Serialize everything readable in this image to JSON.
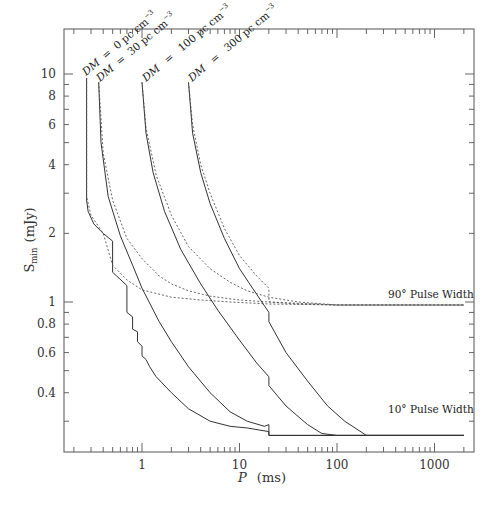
{
  "chart_data": {
    "type": "line",
    "title": "",
    "xlabel": "P (ms)",
    "ylabel": "S_min (mJy)",
    "xscale": "log",
    "yscale": "log",
    "xlim": [
      0.16,
      2500
    ],
    "ylim": [
      0.22,
      15.5
    ],
    "grid": false,
    "legend": "none (inline annotations)",
    "x_ticks": [
      1,
      10,
      100,
      1000
    ],
    "x_tick_labels": [
      "1",
      "10",
      "100",
      "1000"
    ],
    "y_ticks": [
      0.4,
      0.6,
      0.8,
      1,
      2,
      4,
      6,
      8,
      10
    ],
    "y_tick_labels": [
      "0.4",
      "0.6",
      "0.8",
      "1",
      "2",
      "4",
      "6",
      "8",
      "10"
    ],
    "annotations": [
      {
        "text": "DM = 0 pc cm⁻³",
        "x": 0.27,
        "y": 9.6,
        "rotation": -40
      },
      {
        "text": "DM = 30 pc cm⁻³",
        "x": 0.35,
        "y": 9.2,
        "rotation": -40
      },
      {
        "text": "DM = 100 pc cm⁻³",
        "x": 1.0,
        "y": 9.2,
        "rotation": -40
      },
      {
        "text": "DM = 300 pc cm⁻³",
        "x": 3.0,
        "y": 9.2,
        "rotation": -40
      },
      {
        "text": "90° Pulse Width",
        "x": 180,
        "y": 1.08
      },
      {
        "text": "10° Pulse Width",
        "x": 180,
        "y": 0.295
      }
    ],
    "series": [
      {
        "name": "DM = 0, 10° pulse width",
        "style": "solid",
        "x": [
          0.27,
          0.27,
          0.28,
          0.32,
          0.4,
          0.5,
          0.5,
          0.55,
          0.7,
          0.7,
          0.8,
          0.8,
          0.9,
          0.9,
          1.0,
          1.0,
          1.1,
          1.2,
          1.4,
          2,
          3,
          5,
          8,
          12,
          20,
          20,
          40,
          100,
          300,
          1000,
          2000
        ],
        "y": [
          9.6,
          2.8,
          2.5,
          2.2,
          2.0,
          1.85,
          1.35,
          1.3,
          1.18,
          0.9,
          0.86,
          0.76,
          0.74,
          0.67,
          0.64,
          0.58,
          0.56,
          0.52,
          0.47,
          0.4,
          0.34,
          0.3,
          0.285,
          0.28,
          0.27,
          0.26,
          0.26,
          0.26,
          0.26,
          0.26,
          0.26
        ]
      },
      {
        "name": "DM = 0, 90° pulse width",
        "style": "dotted",
        "x": [
          0.27,
          0.27,
          0.3,
          0.4,
          0.5,
          0.7,
          1,
          2,
          4,
          8,
          20,
          100,
          1000,
          2000
        ],
        "y": [
          9.6,
          2.9,
          2.4,
          2.0,
          1.45,
          1.25,
          1.13,
          1.05,
          1.02,
          1.0,
          0.98,
          0.97,
          0.97,
          0.97
        ]
      },
      {
        "name": "DM = 30, 10° pulse width",
        "style": "solid",
        "x": [
          0.36,
          0.38,
          0.45,
          0.6,
          0.8,
          1.0,
          1.5,
          2,
          3,
          5,
          8,
          12,
          18,
          20,
          20,
          30,
          50,
          70,
          100,
          1000,
          2000
        ],
        "y": [
          9.2,
          5.0,
          2.9,
          1.95,
          1.45,
          1.15,
          0.82,
          0.67,
          0.52,
          0.4,
          0.33,
          0.3,
          0.285,
          0.29,
          0.26,
          0.26,
          0.26,
          0.26,
          0.26,
          0.26,
          0.26
        ]
      },
      {
        "name": "DM = 30, 90° pulse width",
        "style": "dotted",
        "x": [
          0.36,
          0.4,
          0.5,
          0.7,
          1.0,
          1.5,
          2,
          3,
          5,
          10,
          20,
          100,
          1000,
          2000
        ],
        "y": [
          9.2,
          4.5,
          2.8,
          1.9,
          1.55,
          1.3,
          1.2,
          1.12,
          1.06,
          1.02,
          1.0,
          0.97,
          0.97,
          0.97
        ]
      },
      {
        "name": "DM = 100, 10° pulse width",
        "style": "solid",
        "x": [
          1.0,
          1.1,
          1.3,
          1.7,
          2.5,
          4,
          6,
          10,
          15,
          20,
          20,
          30,
          50,
          70,
          100,
          1000,
          2000
        ],
        "y": [
          9.2,
          5.5,
          3.7,
          2.5,
          1.7,
          1.2,
          0.92,
          0.68,
          0.54,
          0.47,
          0.43,
          0.35,
          0.29,
          0.265,
          0.26,
          0.26,
          0.26
        ]
      },
      {
        "name": "DM = 100, 90° pulse width",
        "style": "dotted",
        "x": [
          1.0,
          1.1,
          1.4,
          2,
          3,
          5,
          8,
          12,
          20,
          40,
          100,
          1000,
          2000
        ],
        "y": [
          9.2,
          5.8,
          3.6,
          2.4,
          1.75,
          1.4,
          1.22,
          1.12,
          1.05,
          1.0,
          0.97,
          0.97,
          0.97
        ]
      },
      {
        "name": "DM = 300, 10° pulse width",
        "style": "solid",
        "x": [
          3.0,
          3.3,
          4,
          5,
          7,
          10,
          15,
          20,
          20,
          30,
          50,
          80,
          120,
          200,
          300,
          1000,
          2000
        ],
        "y": [
          9.2,
          5.5,
          3.7,
          2.7,
          1.9,
          1.4,
          1.08,
          0.9,
          0.82,
          0.6,
          0.45,
          0.35,
          0.3,
          0.26,
          0.26,
          0.26,
          0.26
        ]
      },
      {
        "name": "DM = 300, 90° pulse width",
        "style": "dotted",
        "x": [
          3.0,
          3.3,
          4,
          5,
          7,
          10,
          15,
          20,
          20,
          40,
          100,
          1000,
          2000
        ],
        "y": [
          9.2,
          6.0,
          4.0,
          3.0,
          2.1,
          1.6,
          1.3,
          1.15,
          1.0,
          0.98,
          0.97,
          0.97,
          0.97
        ]
      }
    ]
  },
  "labels": {
    "xlabel_var": "P",
    "xlabel_unit": "(ms)",
    "ylabel_var": "S",
    "ylabel_sub": "min",
    "ylabel_unit": "(mJy)",
    "dm_prefix": "DM",
    "dm_eq": "=",
    "dm_values": [
      "0 pc cm",
      "30 pc cm",
      "100 pc cm",
      "300 pc cm"
    ],
    "dm_exp": "−3",
    "pw90": "90° Pulse Width",
    "pw10": "10° Pulse Width"
  },
  "colors": {
    "axis": "#555555",
    "curve": "#333333",
    "text": "#333333",
    "background": "#ffffff"
  }
}
